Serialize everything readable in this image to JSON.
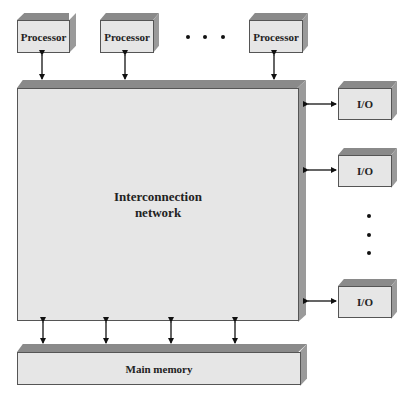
{
  "diagram": {
    "processors": [
      {
        "label": "Processor"
      },
      {
        "label": "Processor"
      },
      {
        "label": "Processor"
      }
    ],
    "processor_ellipsis": "• • •",
    "interconnection_network": {
      "line1": "Interconnection",
      "line2": "network"
    },
    "io_modules": [
      {
        "label": "I/O"
      },
      {
        "label": "I/O"
      },
      {
        "label": "I/O"
      }
    ],
    "io_ellipsis": "vertical-dots",
    "main_memory": {
      "label": "Main memory"
    },
    "connections": {
      "processor_to_network": 3,
      "network_to_io": 3,
      "network_to_memory": 4,
      "arrow_type": "bidirectional"
    },
    "colors": {
      "face": "#e6e6e6",
      "top_bevel": "#8a8a8a",
      "side_bevel": "#9a9a9a",
      "outline": "#555555",
      "arrow": "#111111"
    }
  }
}
